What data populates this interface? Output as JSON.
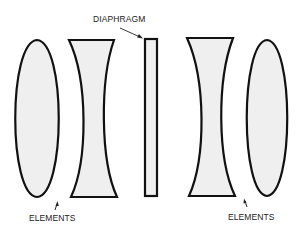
{
  "diagram": {
    "labels": {
      "diaphragm": "DIAPHRAGM",
      "elements_left": "ELEMENTS",
      "elements_right": "ELEMENTS"
    },
    "colors": {
      "fill": "#efefef",
      "stroke": "#111111",
      "background": "#ffffff"
    },
    "components": [
      {
        "name": "left-convex-element",
        "type": "biconvex lens"
      },
      {
        "name": "left-concave-element",
        "type": "biconcave lens"
      },
      {
        "name": "diaphragm",
        "type": "aperture plate"
      },
      {
        "name": "right-concave-element",
        "type": "biconcave lens"
      },
      {
        "name": "right-convex-element",
        "type": "biconvex lens"
      }
    ]
  }
}
